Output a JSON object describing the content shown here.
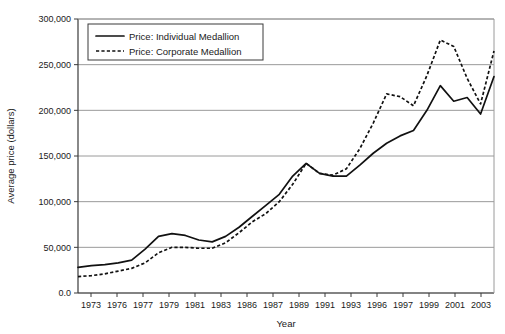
{
  "chart_data": {
    "type": "line",
    "title": "",
    "xlabel": "Year",
    "ylabel": "Average price (dollars)",
    "ylim": [
      0,
      300000
    ],
    "ytick_labels": [
      "0.0",
      "50,000",
      "100,000",
      "150,000",
      "200,000",
      "250,000",
      "300,000"
    ],
    "ytick_values": [
      0,
      50000,
      100000,
      150000,
      200000,
      250000,
      300000
    ],
    "grid": true,
    "legend_position": "top-left-inside",
    "xtick_labels": [
      "1973",
      "1976",
      "1977",
      "1979",
      "1981",
      "1983",
      "1986",
      "1987",
      "1989",
      "1991",
      "1993",
      "1996",
      "1997",
      "1999",
      "2001",
      "2003"
    ],
    "x": [
      1973,
      1974,
      1975,
      1976,
      1977,
      1978,
      1979,
      1980,
      1981,
      1982,
      1983,
      1984,
      1985,
      1986,
      1987,
      1988,
      1989,
      1990,
      1991,
      1992,
      1993,
      1994,
      1995,
      1996,
      1997,
      1998,
      1999,
      2000,
      2001,
      2002,
      2003,
      2004
    ],
    "series": [
      {
        "name": "Price: Individual Medallion",
        "style": "solid",
        "values": [
          28000,
          30000,
          31000,
          33000,
          36000,
          48000,
          62000,
          65000,
          63000,
          58000,
          56000,
          62000,
          72000,
          84000,
          96000,
          108000,
          128000,
          142000,
          131000,
          128000,
          128000,
          140000,
          153000,
          164000,
          172000,
          178000,
          200000,
          227000,
          210000,
          214000,
          196000,
          237000
        ]
      },
      {
        "name": "Price: Corporate Medallion",
        "style": "dashed",
        "values": [
          18000,
          19000,
          21000,
          24000,
          27000,
          33000,
          44000,
          50000,
          50000,
          49000,
          49000,
          55000,
          66000,
          78000,
          87000,
          100000,
          119000,
          142000,
          131000,
          129000,
          136000,
          158000,
          186000,
          218000,
          215000,
          205000,
          238000,
          277000,
          270000,
          235000,
          207000,
          265000
        ]
      }
    ]
  }
}
